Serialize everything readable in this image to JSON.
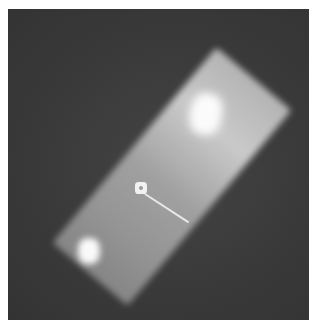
{
  "image": {
    "description": "Grayscale radiograph-like photo of a glowing tilted rectangular plate with a pin",
    "colors": {
      "border": "#ffffff",
      "background": "#3a3a3a",
      "plate": "#b5b5b5",
      "highlight": "#fbfbfb"
    }
  }
}
